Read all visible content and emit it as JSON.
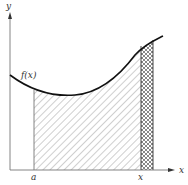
{
  "figure": {
    "labels": {
      "y_axis": "y",
      "x_axis": "x",
      "curve": "f(x)",
      "lower_limit": "a",
      "upper_point": "x"
    },
    "colors": {
      "axis": "#777777",
      "curve": "#111111",
      "hatch": "#888888",
      "crosshatch": "#555555"
    }
  }
}
